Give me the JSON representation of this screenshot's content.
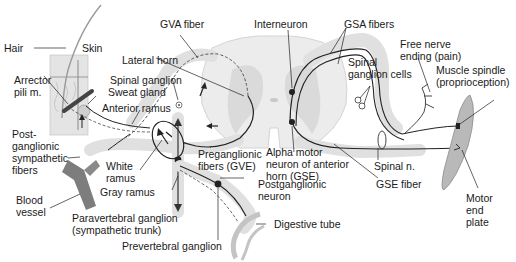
{
  "diagram": {
    "type": "anatomical-schematic",
    "colors": {
      "tissue": "#e6e6e6",
      "tissue_dark": "#d2d2d2",
      "fiber": "#222222",
      "muscle": "#b8b8b8",
      "vessel": "#7a7a7a",
      "label": "#1a1a1a"
    },
    "labels": {
      "hair": "Hair",
      "skin": "Skin",
      "arrector_pili": "Arrector\npili m.",
      "sweat_gland": "Sweat gland",
      "postganglionic_sympathetic_fibers": "Post-\nganglionic\nsympathetic\nfibers",
      "blood_vessel": "Blood\nvessel",
      "gva_fiber": "GVA fiber",
      "lateral_horn": "Lateral horn",
      "spinal_ganglion": "Spinal ganglion",
      "anterior_ramus": "Anterior ramus",
      "white_ramus": "White\nramus",
      "gray_ramus": "Gray ramus",
      "paravertebral_ganglion": "Paravertebral ganglion\n(sympathetic trunk)",
      "prevertebral_ganglion": "Prevertebral ganglion",
      "preganglionic_fibers": "Preganglionic\nfibers (GVE)",
      "postganglionic_neuron": "Postganglionic\nneuron",
      "digestive_tube": "Digestive tube",
      "interneuron": "Interneuron",
      "alpha_motor_neuron": "Alpha motor\nneuron of anterior\nhorn (GSE)",
      "gsa_fibers": "GSA fibers",
      "spinal_ganglion_cells": "Spinal\nganglion cells",
      "free_nerve_ending": "Free nerve\nending (pain)",
      "muscle_spindle": "Muscle spindle\n(proprioception)",
      "spinal_n": "Spinal n.",
      "gse_fiber": "GSE fiber",
      "motor_end_plate": "Motor\nend\nplate"
    }
  }
}
